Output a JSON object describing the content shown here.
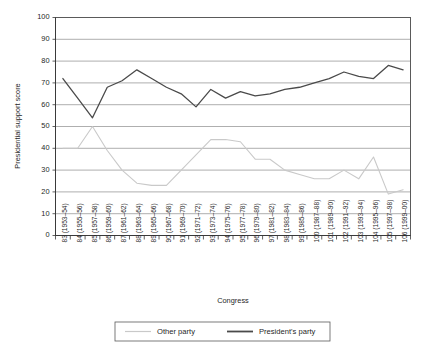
{
  "chart_data": {
    "type": "line",
    "title": "",
    "xlabel": "Congress",
    "ylabel": "Presidential support score",
    "ylim": [
      0,
      100
    ],
    "ytick_values": [
      0,
      10,
      20,
      30,
      40,
      50,
      60,
      70,
      80,
      90,
      100
    ],
    "grid": true,
    "legend_position": "bottom",
    "categories": [
      "83 (1953–54)",
      "84 (1955–56)",
      "85 (1957–58)",
      "86 (1959–60)",
      "87 (1961–62)",
      "88 (1963–64)",
      "89 (1965–66)",
      "90 (1967–68)",
      "91 (1969–70)",
      "92 (1971–72)",
      "93 (1973–74)",
      "94 (1975–76)",
      "95 (1977–78)",
      "96 (1979–80)",
      "97 (1981–82)",
      "98 (1983–84)",
      "99 (1985–86)",
      "100 (1987–88)",
      "101 (1989–90)",
      "102 (1991–92)",
      "103 (1993–94)",
      "104 (1995–96)",
      "105 (1997–98)",
      "106 (1999–00)"
    ],
    "series": [
      {
        "name": "Other party",
        "color": "#c9c9c9",
        "values": [
          40,
          40,
          50,
          39,
          30,
          24,
          23,
          23,
          30,
          37,
          44,
          44,
          43,
          35,
          35,
          30,
          28,
          26,
          26,
          30,
          26,
          36,
          19,
          21
        ]
      },
      {
        "name": "President's party",
        "color": "#4a4a4a",
        "values": [
          72,
          63,
          54,
          68,
          71,
          76,
          72,
          68,
          65,
          59,
          67,
          63,
          66,
          64,
          65,
          67,
          68,
          70,
          72,
          75,
          73,
          72,
          78,
          76
        ]
      }
    ]
  },
  "legend": {
    "entries": [
      {
        "label": "Other party"
      },
      {
        "label": "President's party"
      }
    ]
  }
}
